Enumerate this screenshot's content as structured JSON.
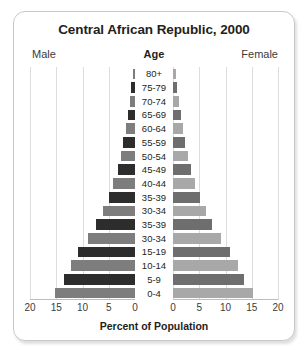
{
  "card": {
    "title": "Central African Republic, 2000",
    "header_male": "Male",
    "header_age": "Age",
    "header_female": "Female",
    "xlabel": "Percent of Population"
  },
  "chart_data": {
    "type": "bar",
    "subtype": "population-pyramid",
    "title": "Central African Republic, 2000",
    "xlabel": "Percent of Population",
    "ylabel": "Age",
    "categories": [
      "80+",
      "75-79",
      "70-74",
      "65-69",
      "60-64",
      "55-59",
      "50-54",
      "45-49",
      "40-44",
      "35-39",
      "30-34",
      "35-39",
      "30-34",
      "15-19",
      "10-14",
      "5-9",
      "0-4"
    ],
    "series": [
      {
        "name": "Male",
        "values": [
          0.4,
          0.7,
          1.0,
          1.4,
          1.8,
          2.2,
          2.7,
          3.3,
          4.1,
          5.0,
          6.1,
          7.4,
          9.0,
          10.8,
          12.2,
          13.5,
          15.2
        ]
      },
      {
        "name": "Female",
        "values": [
          0.5,
          0.8,
          1.1,
          1.5,
          1.9,
          2.3,
          2.8,
          3.4,
          4.2,
          5.1,
          6.2,
          7.5,
          9.1,
          10.9,
          12.3,
          13.6,
          15.3
        ]
      }
    ],
    "xticks_male": [
      20,
      15,
      10,
      5,
      0
    ],
    "xticks_female": [
      0,
      5,
      10,
      15,
      20
    ],
    "xlim": [
      0,
      20
    ],
    "grid": true,
    "legend": [
      "Male",
      "Female"
    ],
    "colors": {
      "male_dark": "#2d2d2d",
      "male_light": "#7d7d7d",
      "female_dark": "#6e6e6e",
      "female_light": "#a8a8a8",
      "grid": "#dcdcdc",
      "border": "#c9c9c9",
      "text": "#231f20"
    }
  }
}
